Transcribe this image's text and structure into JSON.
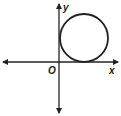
{
  "diagram": {
    "type": "coordinate-plane",
    "labels": {
      "x_axis": "x",
      "y_axis": "y",
      "origin": "O"
    },
    "shapes": [
      {
        "type": "circle",
        "description": "circle tangent to x-axis and y-axis in quadrant I"
      }
    ],
    "colors": {
      "stroke": "#222222",
      "background": "#ffffff"
    }
  }
}
